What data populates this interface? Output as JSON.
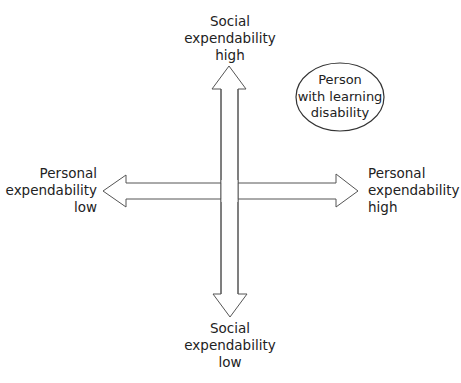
{
  "diagram": {
    "type": "quadrant-axes",
    "colors": {
      "stroke": "#555555",
      "fill": "#ffffff",
      "text": "#222222"
    },
    "axes": {
      "vertical": {
        "name": "Social expendability",
        "top_label": [
          "Social",
          "expendability",
          "high"
        ],
        "bottom_label": [
          "Social",
          "expendability",
          "low"
        ]
      },
      "horizontal": {
        "name": "Personal expendability",
        "left_label": [
          "Personal",
          "expendability",
          "low"
        ],
        "right_label": [
          "Personal",
          "expendability",
          "high"
        ]
      }
    },
    "nodes": [
      {
        "shape": "ellipse",
        "quadrant": "top-right",
        "label": [
          "Person",
          "with learning",
          "disability"
        ]
      }
    ]
  }
}
